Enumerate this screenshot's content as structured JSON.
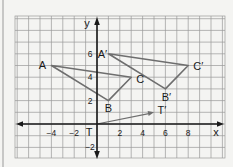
{
  "diagram": {
    "type": "coordinate-plane-translation",
    "axes": {
      "x_label": "x",
      "y_label": "y",
      "x_ticks": [
        {
          "value": -4,
          "label": "−4"
        },
        {
          "value": -2,
          "label": "−2"
        },
        {
          "value": 2,
          "label": "2"
        },
        {
          "value": 4,
          "label": "4"
        },
        {
          "value": 6,
          "label": "6"
        },
        {
          "value": 8,
          "label": "8"
        }
      ],
      "y_ticks": [
        {
          "value": 6,
          "label": "6"
        },
        {
          "value": 4,
          "label": "4"
        },
        {
          "value": 2,
          "label": "2"
        },
        {
          "value": -2,
          "label": "−2"
        }
      ],
      "x_range": [
        -6,
        10
      ],
      "y_range": [
        -3,
        9
      ]
    },
    "points": {
      "A": {
        "label": "A",
        "x": -4,
        "y": 5
      },
      "B": {
        "label": "B",
        "x": 1,
        "y": 2
      },
      "C": {
        "label": "C",
        "x": 3,
        "y": 4
      },
      "A_prime": {
        "label": "A′",
        "x": 1,
        "y": 6
      },
      "B_prime": {
        "label": "B′",
        "x": 6,
        "y": 3
      },
      "C_prime": {
        "label": "C′",
        "x": 8,
        "y": 5
      },
      "T": {
        "label": "T",
        "x": 0,
        "y": 0
      },
      "T_prime": {
        "label": "T′",
        "x": 5,
        "y": 1
      }
    },
    "triangles": [
      {
        "name": "ABC",
        "vertices": [
          "A",
          "B",
          "C"
        ]
      },
      {
        "name": "A'B'C'",
        "vertices": [
          "A_prime",
          "B_prime",
          "C_prime"
        ]
      }
    ],
    "vector": {
      "from": "T",
      "to": "T_prime"
    },
    "colors": {
      "background": "#f4f4f2",
      "grid": "#9a9a9a",
      "axis": "#1a1a1a",
      "shape": "#6e6e6e",
      "text": "#1a1a1a"
    }
  }
}
